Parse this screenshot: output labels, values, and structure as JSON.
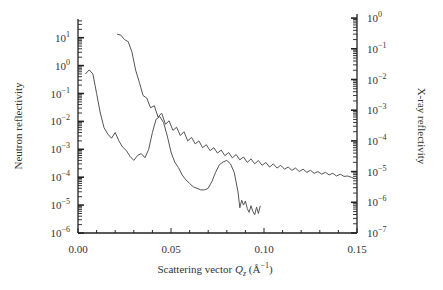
{
  "chart_data": {
    "type": "line",
    "title": "",
    "xlabel": "Scattering vector Q_z (Å^-1)",
    "xlabel_parts": {
      "prefix": "Scattering vector ",
      "var": "Q",
      "sub": "z",
      "unit": " (Å",
      "exp": "−1",
      "close": ")"
    },
    "ylabel_left": "Neutron reflectivity",
    "ylabel_right": "X-ray reflectivity",
    "xlim": [
      0.0,
      0.15
    ],
    "ylim_left": [
      1e-06,
      30
    ],
    "ylim_right": [
      1e-07,
      1.5
    ],
    "yscale": "log",
    "grid": false,
    "legend": null,
    "x_ticks": [
      "0.00",
      "0.05",
      "0.10",
      "0.15"
    ],
    "y_ticks_left": [
      {
        "base": "10",
        "exp": "1"
      },
      {
        "base": "10",
        "exp": "0"
      },
      {
        "base": "10",
        "exp": "−1"
      },
      {
        "base": "10",
        "exp": "−2"
      },
      {
        "base": "10",
        "exp": "−3"
      },
      {
        "base": "10",
        "exp": "−4"
      },
      {
        "base": "10",
        "exp": "−5"
      },
      {
        "base": "10",
        "exp": "−6"
      }
    ],
    "y_ticks_right": [
      {
        "base": "10",
        "exp": "0"
      },
      {
        "base": "10",
        "exp": "−1"
      },
      {
        "base": "10",
        "exp": "−2"
      },
      {
        "base": "10",
        "exp": "−3"
      },
      {
        "base": "10",
        "exp": "−4"
      },
      {
        "base": "10",
        "exp": "−5"
      },
      {
        "base": "10",
        "exp": "−6"
      },
      {
        "base": "10",
        "exp": "−7"
      }
    ],
    "series": [
      {
        "name": "Neutron reflectivity",
        "axis": "left",
        "color": "#555555",
        "x": [
          0.004,
          0.006,
          0.008,
          0.01,
          0.012,
          0.014,
          0.016,
          0.018,
          0.02,
          0.022,
          0.024,
          0.026,
          0.028,
          0.03,
          0.032,
          0.034,
          0.036,
          0.038,
          0.04,
          0.042,
          0.044,
          0.046,
          0.048,
          0.05,
          0.052,
          0.054,
          0.056,
          0.058,
          0.06,
          0.062,
          0.064,
          0.066,
          0.068,
          0.07,
          0.072,
          0.074,
          0.076,
          0.078,
          0.08,
          0.082,
          0.084,
          0.086,
          0.087,
          0.088,
          0.089,
          0.09,
          0.091,
          0.092,
          0.093,
          0.094,
          0.095,
          0.096,
          0.097,
          0.098
        ],
        "y": [
          0.5,
          0.7,
          0.5,
          0.1,
          0.02,
          0.006,
          0.0035,
          0.0025,
          0.004,
          0.002,
          0.0012,
          0.0009,
          0.00055,
          0.0004,
          0.0006,
          0.0007,
          0.0005,
          0.001,
          0.004,
          0.012,
          0.015,
          0.009,
          0.003,
          0.0008,
          0.00035,
          0.00022,
          0.00012,
          8e-05,
          6e-05,
          4.5e-05,
          4e-05,
          3.5e-05,
          3.5e-05,
          4e-05,
          7e-05,
          0.00015,
          0.00028,
          0.00035,
          0.0004,
          0.0003,
          0.00015,
          3e-05,
          8e-06,
          1.5e-05,
          1e-05,
          1.4e-05,
          7.5e-06,
          5.5e-06,
          9.5e-06,
          6e-06,
          4.5e-06,
          8.5e-06,
          5e-06,
          9.5e-06
        ]
      },
      {
        "name": "X-ray reflectivity",
        "axis": "right",
        "color": "#555555",
        "x": [
          0.021,
          0.023,
          0.025,
          0.027,
          0.029,
          0.031,
          0.033,
          0.035,
          0.037,
          0.039,
          0.041,
          0.043,
          0.045,
          0.047,
          0.049,
          0.051,
          0.053,
          0.055,
          0.057,
          0.059,
          0.061,
          0.063,
          0.065,
          0.067,
          0.069,
          0.071,
          0.073,
          0.075,
          0.077,
          0.079,
          0.081,
          0.083,
          0.085,
          0.087,
          0.089,
          0.091,
          0.093,
          0.095,
          0.097,
          0.099,
          0.101,
          0.103,
          0.105,
          0.107,
          0.109,
          0.111,
          0.113,
          0.115,
          0.117,
          0.119,
          0.121,
          0.123,
          0.125,
          0.127,
          0.129,
          0.131,
          0.133,
          0.135,
          0.137,
          0.139,
          0.141,
          0.143,
          0.145,
          0.147,
          0.149
        ],
        "y": [
          0.3,
          0.28,
          0.2,
          0.17,
          0.08,
          0.02,
          0.008,
          0.003,
          0.0025,
          0.0012,
          0.0014,
          0.0006,
          0.0008,
          0.00035,
          0.00045,
          0.00022,
          0.00028,
          0.00015,
          0.0002,
          0.0001,
          0.00013,
          8e-05,
          0.0001,
          6e-05,
          7.5e-05,
          4.8e-05,
          6e-05,
          4e-05,
          5e-05,
          3.3e-05,
          4.2e-05,
          2.8e-05,
          3.6e-05,
          2.4e-05,
          3e-05,
          2e-05,
          2.6e-05,
          1.8e-05,
          2.3e-05,
          1.6e-05,
          2e-05,
          1.4e-05,
          1.8e-05,
          1.3e-05,
          1.6e-05,
          1.2e-05,
          1.4e-05,
          1.1e-05,
          1.3e-05,
          1e-05,
          1.2e-05,
          9.5e-06,
          1.1e-05,
          8.8e-06,
          1e-05,
          8.2e-06,
          9.5e-06,
          7.8e-06,
          8.8e-06,
          7.2e-06,
          8.2e-06,
          7e-06,
          7.2e-06,
          6.5e-06,
          5.8e-06
        ]
      }
    ]
  }
}
